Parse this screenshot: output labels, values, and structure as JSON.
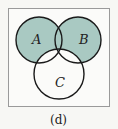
{
  "diagram": {
    "type": "venn",
    "sets": [
      "A",
      "B",
      "C"
    ],
    "labels": {
      "a": "A",
      "b": "B",
      "c": "C"
    },
    "shaded_regions": [
      "A only",
      "B only",
      "A∩B (not C)",
      "A∩B∩C"
    ],
    "unshaded_regions": [
      "A∩C (not B)",
      "B∩C (not A)",
      "C only",
      "outside"
    ],
    "caption": "(d)",
    "colors": {
      "shade": "#a9c9c2",
      "stroke": "#1a1a1a",
      "frame": "#9a9a9a",
      "background": "#f7f7f4"
    }
  }
}
